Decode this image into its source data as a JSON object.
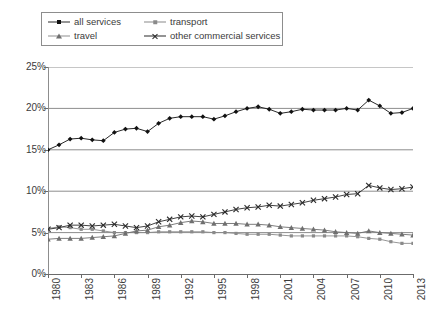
{
  "legend": {
    "position": "top-left",
    "items": [
      {
        "label": "all services",
        "marker": "diamond",
        "color": "#111111"
      },
      {
        "label": "transport",
        "marker": "square",
        "color": "#8a8a8a"
      },
      {
        "label": "travel",
        "marker": "triangle",
        "color": "#6f6f6f"
      },
      {
        "label": "other commercial services",
        "marker": "cross",
        "color": "#2b2b2b"
      }
    ]
  },
  "axes": {
    "y_ticks": [
      "25%",
      "20%",
      "15%",
      "10%",
      "5%",
      "0%"
    ],
    "x_ticks": [
      "1980",
      "1983",
      "1986",
      "1989",
      "1992",
      "1995",
      "1998",
      "2001",
      "2004",
      "2007",
      "2010",
      "2013"
    ]
  },
  "chart_data": {
    "type": "line",
    "title": "",
    "subtitle": "",
    "xlabel": "",
    "ylabel": "",
    "xlim": [
      1980,
      2013
    ],
    "ylim": [
      0,
      25
    ],
    "y_unit": "percent",
    "grid": "horizontal",
    "legend_position": "top-left",
    "x": [
      1980,
      1981,
      1982,
      1983,
      1984,
      1985,
      1986,
      1987,
      1988,
      1989,
      1990,
      1991,
      1992,
      1993,
      1994,
      1995,
      1996,
      1997,
      1998,
      1999,
      2000,
      2001,
      2002,
      2003,
      2004,
      2005,
      2006,
      2007,
      2008,
      2009,
      2010,
      2011,
      2012,
      2013
    ],
    "series": [
      {
        "name": "all services",
        "marker": "diamond",
        "color": "#111111",
        "values": [
          15.0,
          15.6,
          16.3,
          16.4,
          16.2,
          16.1,
          17.1,
          17.5,
          17.6,
          17.2,
          18.2,
          18.8,
          19.0,
          19.0,
          19.0,
          18.7,
          19.1,
          19.6,
          20.0,
          20.2,
          19.9,
          19.4,
          19.6,
          19.9,
          19.8,
          19.8,
          19.8,
          20.0,
          19.8,
          21.0,
          20.3,
          19.4,
          19.5,
          20.0
        ]
      },
      {
        "name": "transport",
        "marker": "square",
        "color": "#8a8a8a",
        "values": [
          5.5,
          5.7,
          5.6,
          5.4,
          5.4,
          5.2,
          5.0,
          5.0,
          5.0,
          5.0,
          5.1,
          5.1,
          5.1,
          5.1,
          5.1,
          5.0,
          5.0,
          4.9,
          4.8,
          4.8,
          4.8,
          4.7,
          4.6,
          4.6,
          4.6,
          4.6,
          4.6,
          4.6,
          4.5,
          4.3,
          4.2,
          3.9,
          3.7,
          3.7
        ]
      },
      {
        "name": "travel",
        "marker": "triangle",
        "color": "#6f6f6f",
        "values": [
          4.2,
          4.3,
          4.3,
          4.3,
          4.4,
          4.5,
          4.6,
          4.9,
          5.2,
          5.3,
          5.7,
          5.9,
          6.2,
          6.4,
          6.3,
          6.1,
          6.1,
          6.1,
          6.0,
          6.0,
          5.9,
          5.7,
          5.6,
          5.5,
          5.4,
          5.3,
          5.1,
          5.0,
          4.9,
          5.2,
          5.0,
          4.9,
          4.8,
          4.7
        ]
      },
      {
        "name": "other commercial services",
        "marker": "cross",
        "color": "#2b2b2b",
        "values": [
          5.4,
          5.6,
          5.9,
          5.9,
          5.8,
          5.9,
          6.0,
          5.8,
          5.6,
          5.8,
          6.3,
          6.6,
          6.9,
          7.0,
          6.9,
          7.2,
          7.5,
          7.8,
          8.0,
          8.1,
          8.3,
          8.2,
          8.4,
          8.6,
          8.9,
          9.1,
          9.3,
          9.6,
          9.7,
          10.7,
          10.4,
          10.2,
          10.3,
          10.5
        ]
      }
    ]
  }
}
